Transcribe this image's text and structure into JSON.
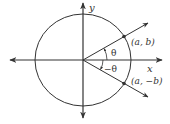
{
  "diagram": {
    "axes": {
      "x_label": "x",
      "y_label": "y"
    },
    "angles": {
      "positive_label": "θ",
      "negative_label": "−θ"
    },
    "points": {
      "upper": "(a, b)",
      "lower": "(a, −b)"
    },
    "colors": {
      "stroke": "#333333",
      "background": "#ffffff"
    }
  }
}
